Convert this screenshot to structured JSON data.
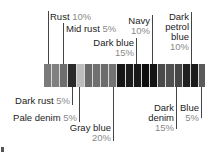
{
  "chart_data": {
    "type": "bar",
    "orientation": "horizontal-stacked",
    "title": "",
    "xlabel": "",
    "ylabel": "",
    "categories": [
      "Rust",
      "Mid rust",
      "Dark rust",
      "Pale denim",
      "Gray blue",
      "Dark blue",
      "Navy",
      "Dark denim",
      "Dark petrol blue",
      "Blue"
    ],
    "values": [
      10,
      5,
      5,
      5,
      20,
      15,
      10,
      15,
      10,
      5
    ],
    "units": "%",
    "segments_per_5pct": 1,
    "total": 100,
    "grid": false,
    "legend": "leader-line labels above and below bar"
  },
  "labels": {
    "rust": {
      "name": "Rust",
      "pct": "10%"
    },
    "mid_rust": {
      "name": "Mid rust",
      "pct": "5%"
    },
    "dark_rust": {
      "name": "Dark rust",
      "pct": "5%"
    },
    "pale_denim": {
      "name": "Pale denim",
      "pct": "5%"
    },
    "gray_blue": {
      "name": "Gray blue",
      "pct": "20%"
    },
    "dark_blue": {
      "name": "Dark blue",
      "pct": "15%"
    },
    "navy": {
      "name": "Navy",
      "pct": "10%"
    },
    "dark_denim": {
      "name1": "Dark",
      "name2": "denim",
      "pct": "15%"
    },
    "dark_petrol_blue": {
      "name1": "Dark",
      "name2": "petrol",
      "name3": "blue",
      "pct": "10%"
    },
    "blue": {
      "name": "Blue",
      "pct": "5%"
    }
  },
  "segment_colors": [
    "#7a7a7a",
    "#808080",
    "#6e6e6e",
    "#2a2a2a",
    "#bdbdbd",
    "#6a6a6a",
    "#707070",
    "#6c6c6c",
    "#747474",
    "#161616",
    "#1c1c1c",
    "#181818",
    "#0e0e0e",
    "#141414",
    "#4a4a4a",
    "#505050",
    "#464646",
    "#202020",
    "#1a1a1a",
    "#5a5a5a"
  ]
}
